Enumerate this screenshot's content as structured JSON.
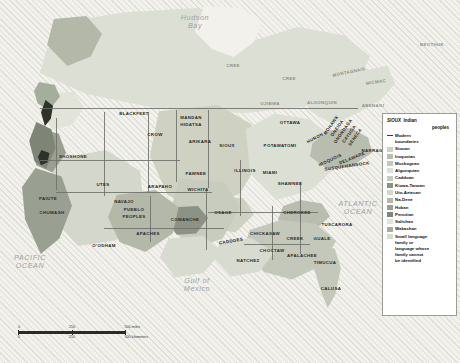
{
  "figure": {
    "caption": "",
    "oceans": [
      {
        "name": "hudson-bay",
        "text": "Hudson\nBay",
        "x": 195,
        "y": 22,
        "size": "lg"
      },
      {
        "name": "atlantic-ocean",
        "text": "ATLANTIC\nOCEAN",
        "x": 358,
        "y": 208,
        "size": "lg"
      },
      {
        "name": "pacific-ocean",
        "text": "PACIFIC\nOCEAN",
        "x": 30,
        "y": 262,
        "size": "lg"
      },
      {
        "name": "gulf-of-mexico",
        "text": "Gulf of\nMexico",
        "x": 197,
        "y": 285,
        "size": "lg"
      }
    ]
  },
  "peoples": [
    {
      "label": "BEOTHUK",
      "x": 432,
      "y": 44,
      "rot": 0,
      "faint": true
    },
    {
      "label": "CREE",
      "x": 233,
      "y": 65,
      "rot": 0,
      "faint": true
    },
    {
      "label": "CREE",
      "x": 289,
      "y": 78,
      "rot": 0,
      "faint": true
    },
    {
      "label": "MONTAGNAIS",
      "x": 349,
      "y": 72,
      "rot": -12,
      "faint": true
    },
    {
      "label": "MICMAC",
      "x": 376,
      "y": 82,
      "rot": -8,
      "faint": true
    },
    {
      "label": "OJIBWA",
      "x": 270,
      "y": 103,
      "rot": 0,
      "faint": true
    },
    {
      "label": "ALGONQUIN",
      "x": 322,
      "y": 102,
      "rot": 0,
      "faint": true
    },
    {
      "label": "ABENAKI",
      "x": 373,
      "y": 105,
      "rot": 0,
      "faint": true
    },
    {
      "label": "BLACKFEET",
      "x": 134,
      "y": 113,
      "rot": 0,
      "faint": false
    },
    {
      "label": "MANDAN",
      "x": 191,
      "y": 117,
      "rot": 0,
      "faint": false
    },
    {
      "label": "HIDATSA",
      "x": 191,
      "y": 124,
      "rot": 0,
      "faint": false
    },
    {
      "label": "OTTAWA",
      "x": 290,
      "y": 122,
      "rot": 0,
      "faint": false
    },
    {
      "label": "CROW",
      "x": 155,
      "y": 134,
      "rot": 0,
      "faint": false
    },
    {
      "label": "ARIKARA",
      "x": 200,
      "y": 141,
      "rot": 0,
      "faint": false
    },
    {
      "label": "SIOUX",
      "x": 227,
      "y": 145,
      "rot": 0,
      "faint": false
    },
    {
      "label": "HURON",
      "x": 315,
      "y": 138,
      "rot": -28,
      "faint": false
    },
    {
      "label": "MOHAWK",
      "x": 331,
      "y": 125,
      "rot": -55,
      "faint": false
    },
    {
      "label": "ONEIDA",
      "x": 337,
      "y": 128,
      "rot": -55,
      "faint": false
    },
    {
      "label": "ONONDAGA",
      "x": 343,
      "y": 131,
      "rot": -55,
      "faint": false
    },
    {
      "label": "CAYUGA",
      "x": 349,
      "y": 134,
      "rot": -55,
      "faint": false
    },
    {
      "label": "SENECA",
      "x": 355,
      "y": 137,
      "rot": -55,
      "faint": false
    },
    {
      "label": "POTAWATOMI",
      "x": 280,
      "y": 145,
      "rot": 0,
      "faint": false
    },
    {
      "label": "IROQUOIS",
      "x": 330,
      "y": 160,
      "rot": -25,
      "faint": false
    },
    {
      "label": "DELAWARE",
      "x": 352,
      "y": 158,
      "rot": -22,
      "faint": false
    },
    {
      "label": "SUSQUEHANNOCK",
      "x": 347,
      "y": 166,
      "rot": -8,
      "faint": false
    },
    {
      "label": "NARRAGANSETT",
      "x": 382,
      "y": 150,
      "rot": 0,
      "faint": false
    },
    {
      "label": "SHOSHONE",
      "x": 73,
      "y": 156,
      "rot": 0,
      "faint": false
    },
    {
      "label": "PAWNEE",
      "x": 196,
      "y": 173,
      "rot": 0,
      "faint": false
    },
    {
      "label": "ILLINOIS",
      "x": 245,
      "y": 170,
      "rot": 0,
      "faint": false
    },
    {
      "label": "MIAMI",
      "x": 270,
      "y": 172,
      "rot": 0,
      "faint": false
    },
    {
      "label": "SHAWNEE",
      "x": 290,
      "y": 183,
      "rot": 0,
      "faint": false
    },
    {
      "label": "UTES",
      "x": 103,
      "y": 184,
      "rot": 0,
      "faint": false
    },
    {
      "label": "ARAPAHO",
      "x": 160,
      "y": 186,
      "rot": 0,
      "faint": false
    },
    {
      "label": "WICHITA",
      "x": 198,
      "y": 189,
      "rot": 0,
      "faint": false
    },
    {
      "label": "PAIUTE",
      "x": 48,
      "y": 198,
      "rot": 0,
      "faint": false
    },
    {
      "label": "NAVAJO",
      "x": 124,
      "y": 201,
      "rot": 0,
      "faint": false
    },
    {
      "label": "PUEBLO",
      "x": 134,
      "y": 209,
      "rot": 0,
      "faint": false
    },
    {
      "label": "PEOPLES",
      "x": 134,
      "y": 216,
      "rot": 0,
      "faint": false
    },
    {
      "label": "OSAGE",
      "x": 223,
      "y": 212,
      "rot": 0,
      "faint": false
    },
    {
      "label": "CHEROKEE",
      "x": 297,
      "y": 212,
      "rot": 0,
      "faint": false
    },
    {
      "label": "COMANCHE",
      "x": 185,
      "y": 219,
      "rot": 0,
      "faint": false
    },
    {
      "label": "CHUMASH",
      "x": 52,
      "y": 212,
      "rot": 0,
      "faint": false
    },
    {
      "label": "CHICKASAW",
      "x": 265,
      "y": 233,
      "rot": 0,
      "faint": false
    },
    {
      "label": "CREEK",
      "x": 295,
      "y": 238,
      "rot": 0,
      "faint": false
    },
    {
      "label": "GUALE",
      "x": 322,
      "y": 238,
      "rot": 0,
      "faint": false
    },
    {
      "label": "APACHES",
      "x": 148,
      "y": 233,
      "rot": 0,
      "faint": false
    },
    {
      "label": "CADDOES",
      "x": 231,
      "y": 241,
      "rot": -10,
      "faint": false
    },
    {
      "label": "CHOCTAW",
      "x": 272,
      "y": 250,
      "rot": 0,
      "faint": false
    },
    {
      "label": "APALACHEE",
      "x": 302,
      "y": 255,
      "rot": 0,
      "faint": false
    },
    {
      "label": "NATCHEZ",
      "x": 248,
      "y": 260,
      "rot": 0,
      "faint": false
    },
    {
      "label": "TIMUCUA",
      "x": 325,
      "y": 262,
      "rot": 0,
      "faint": false
    },
    {
      "label": "TUSCARORA",
      "x": 337,
      "y": 224,
      "rot": 0,
      "faint": false
    },
    {
      "label": "O'ODHAM",
      "x": 104,
      "y": 245,
      "rot": 0,
      "faint": false
    },
    {
      "label": "CALUSA",
      "x": 331,
      "y": 288,
      "rot": 0,
      "faint": false
    }
  ],
  "legend": {
    "title_name": "SIOUX",
    "title_rest": "Indian",
    "title_second": "peoples",
    "items": [
      {
        "label": "Modern\nboundaries",
        "color": "line",
        "type": "line"
      },
      {
        "label": "Siouan",
        "color": "#cfd2c2",
        "type": "swatch"
      },
      {
        "label": "Iroquoian",
        "color": "#b9bdb0",
        "type": "swatch"
      },
      {
        "label": "Muskogean",
        "color": "#c4c8bb",
        "type": "swatch"
      },
      {
        "label": "Algonquian",
        "color": "#dcdfd4",
        "type": "swatch"
      },
      {
        "label": "Caddoan",
        "color": "#c8ccbe",
        "type": "swatch"
      },
      {
        "label": "Kiowa-Tanoan",
        "color": "#8d9384",
        "type": "swatch"
      },
      {
        "label": "Uto-Aztecan",
        "color": "#d4d7cb",
        "type": "swatch"
      },
      {
        "label": "Na-Dene",
        "color": "#b3b8a9",
        "type": "swatch"
      },
      {
        "label": "Hokan",
        "color": "#9aa091",
        "type": "swatch"
      },
      {
        "label": "Penutian",
        "color": "#7e8577",
        "type": "swatch"
      },
      {
        "label": "Salishan",
        "color": "#e2e4da",
        "type": "swatch"
      },
      {
        "label": "Wakashan",
        "color": "#a7ad9d",
        "type": "swatch"
      },
      {
        "label": "Small language\nfamily or\nlanguage whose\nfamily cannot\nbe identified",
        "color": "#d8dbd0",
        "type": "swatch"
      }
    ]
  },
  "scale": {
    "miles": {
      "ticks": [
        "0",
        "250",
        "500"
      ],
      "unit": "miles"
    },
    "kilometers": {
      "ticks": [
        "0",
        "250",
        "500"
      ],
      "unit": "kilometers"
    }
  }
}
